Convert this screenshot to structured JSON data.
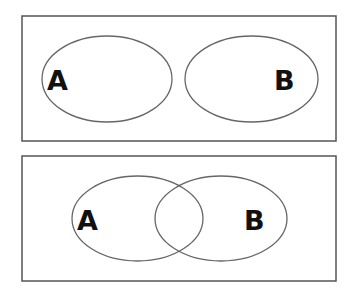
{
  "diagrams": [
    {
      "name": "disjoint-sets",
      "sets": [
        {
          "label": "A"
        },
        {
          "label": "B"
        }
      ]
    },
    {
      "name": "overlapping-sets",
      "sets": [
        {
          "label": "A"
        },
        {
          "label": "B"
        }
      ]
    }
  ],
  "colors": {
    "frame_stroke": "#555555",
    "set_stroke": "#666666",
    "label": "#111111",
    "background": "#ffffff"
  }
}
